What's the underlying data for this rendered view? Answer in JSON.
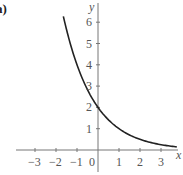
{
  "panel_label": "a)",
  "chart_data": {
    "type": "line",
    "title": "",
    "xlabel": "x",
    "ylabel": "y",
    "function": "y = 2(0.5)^x",
    "x_ticks": [
      -3,
      -2,
      -1,
      0,
      1,
      2,
      3
    ],
    "x_tick_labels": [
      "−3",
      "−2",
      "−1",
      "0",
      "1",
      "2",
      "3"
    ],
    "y_ticks": [
      1,
      2,
      3,
      4,
      5,
      6
    ],
    "y_tick_labels": [
      "1",
      "2",
      "3",
      "4",
      "5",
      "6"
    ],
    "xlim": [
      -3.9,
      3.9
    ],
    "ylim": [
      -0.9,
      7.1
    ],
    "grid": false,
    "legend": null,
    "series": [
      {
        "name": "curve",
        "color": "#222222",
        "x": [
          -1.65,
          -1.5,
          -1.0,
          -0.5,
          0,
          0.5,
          1,
          1.5,
          2,
          2.5,
          3,
          3.5,
          3.75
        ],
        "y": [
          6.28,
          5.66,
          4.0,
          2.83,
          2.0,
          1.41,
          1.0,
          0.71,
          0.5,
          0.35,
          0.25,
          0.18,
          0.15
        ]
      }
    ],
    "annotations": [
      {
        "text": "y-intercept",
        "x": 0,
        "y": 2
      }
    ]
  },
  "axis_color": "#777777"
}
